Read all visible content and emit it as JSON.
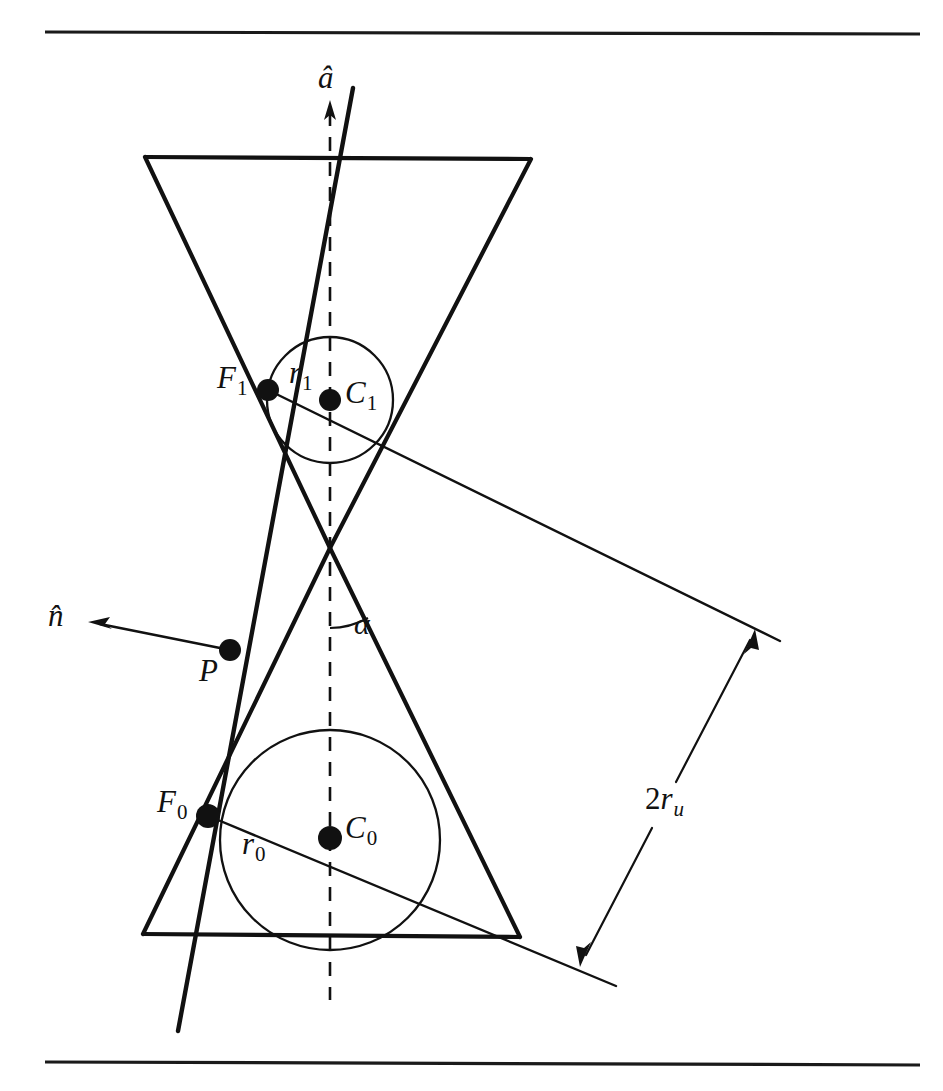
{
  "figure": {
    "background_color": "#ffffff",
    "ink_color": "#111111",
    "width": 943,
    "height": 1091
  },
  "rules": {
    "top_rule_y": 32,
    "bottom_rule_y": 1063,
    "x_start": 45,
    "x_end": 920
  },
  "labels": {
    "axis": {
      "base": "a",
      "accent": "hat",
      "text": "â",
      "x": 318,
      "y": 64
    },
    "normal": {
      "base": "n",
      "accent": "hat",
      "text": "n̂",
      "x": 48,
      "y": 600
    },
    "point_p": {
      "text": "P",
      "x": 200,
      "y": 655
    },
    "focus_0": {
      "text": "F",
      "sub": "0",
      "x": 158,
      "y": 785
    },
    "focus_1": {
      "text": "F",
      "sub": "1",
      "x": 219,
      "y": 363
    },
    "center_0": {
      "text": "C",
      "sub": "0",
      "x": 345,
      "y": 812
    },
    "center_1": {
      "text": "C",
      "sub": "1",
      "x": 345,
      "y": 377
    },
    "radius_0": {
      "text": "r",
      "sub": "0",
      "x": 243,
      "y": 828
    },
    "radius_1": {
      "text": "r",
      "sub": "1",
      "x": 289,
      "y": 358
    },
    "alpha": {
      "text": "α",
      "x": 354,
      "y": 608
    },
    "diameter_u": {
      "prefix": "2",
      "text": "r",
      "sub": "u",
      "x": 648,
      "y": 782
    }
  },
  "geometry": {
    "cone": {
      "apex": {
        "x": 330,
        "y": 548
      },
      "top_base": {
        "left_x": 145,
        "right_x": 531,
        "y": 157
      },
      "bottom_base": {
        "left_x": 143,
        "right_x": 520,
        "y": 935
      },
      "half_angle_label": "α"
    },
    "axis": {
      "x": 330,
      "y_top": 104,
      "y_bottom": 1000,
      "style": "dashed",
      "arrow_at": "top"
    },
    "cutting_plane_line": {
      "x1": 353,
      "y1": 88,
      "x2": 178,
      "y2": 1031,
      "style": "solid-thick"
    },
    "sphere_upper": {
      "center": {
        "x": 330,
        "y": 400
      },
      "radius": 63,
      "center_label": "C1",
      "tangent_point_label": "F1"
    },
    "sphere_lower": {
      "center": {
        "x": 330,
        "y": 840
      },
      "radius": 110,
      "center_label": "C0",
      "tangent_point_label": "F0"
    },
    "focus_upper": {
      "x": 268,
      "y": 390
    },
    "focus_lower": {
      "x": 208,
      "y": 816
    },
    "point_p": {
      "x": 230,
      "y": 650
    },
    "normal_vector": {
      "from": {
        "x": 230,
        "y": 650
      },
      "to": {
        "x": 92,
        "y": 622
      }
    },
    "chord_upper": {
      "x1": 268,
      "y1": 390,
      "x2": 780,
      "y2": 640
    },
    "chord_lower": {
      "x1": 208,
      "y1": 816,
      "x2": 616,
      "y2": 986
    },
    "dimension_2ru": {
      "arrow_top": {
        "x": 745,
        "y": 632
      },
      "arrow_bottom": {
        "x": 583,
        "y": 962
      },
      "gap_label": "2r_u"
    }
  }
}
